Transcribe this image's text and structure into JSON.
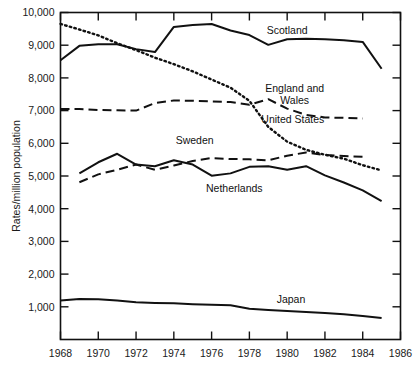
{
  "chart_data": {
    "type": "line",
    "title": "",
    "xlabel": "",
    "ylabel": "Rates/million population",
    "xlim": [
      1968,
      1986
    ],
    "ylim": [
      0,
      10000
    ],
    "xticks": [
      1968,
      1970,
      1972,
      1974,
      1976,
      1978,
      1980,
      1982,
      1984,
      1986
    ],
    "yticks": [
      1000,
      2000,
      3000,
      4000,
      5000,
      6000,
      7000,
      8000,
      9000,
      10000
    ],
    "ytick_labels": [
      "1,000",
      "2,000",
      "3,000",
      "4,000",
      "5,000",
      "6,000",
      "7,000",
      "8,000",
      "9,000",
      "10,000"
    ],
    "xtick_labels": [
      "1968",
      "1970",
      "1972",
      "1974",
      "1976",
      "1978",
      "1980",
      "1982",
      "1984",
      "1986"
    ],
    "grid": false,
    "legend_position": "inline-annotations",
    "series": [
      {
        "name": "Scotland",
        "style": "solid",
        "color": "#111111",
        "label_x": 1980.0,
        "label_y": 9350,
        "x": [
          1968,
          1969,
          1970,
          1971,
          1972,
          1973,
          1974,
          1975,
          1976,
          1977,
          1978,
          1979,
          1980,
          1981,
          1982,
          1983,
          1984,
          1985
        ],
        "y": [
          8540,
          8980,
          9030,
          9030,
          8880,
          8790,
          9560,
          9620,
          9650,
          9450,
          9310,
          9010,
          9180,
          9200,
          9180,
          9150,
          9100,
          8280
        ]
      },
      {
        "name": "United States",
        "style": "dotted",
        "color": "#111111",
        "label_x": 1980.3,
        "label_y": 6620,
        "x": [
          1968,
          1969,
          1970,
          1971,
          1972,
          1973,
          1974,
          1975,
          1976,
          1977,
          1978,
          1979,
          1980,
          1981,
          1982,
          1983,
          1984,
          1985
        ],
        "y": [
          9650,
          9480,
          9300,
          9060,
          8850,
          8620,
          8420,
          8200,
          7950,
          7700,
          7300,
          6500,
          6050,
          5800,
          5650,
          5530,
          5330,
          5170
        ]
      },
      {
        "name": "England and Wales",
        "style": "dashed",
        "color": "#111111",
        "label_x": 1980.4,
        "label_y": 7560,
        "label_line2": "Wales",
        "x": [
          1968,
          1969,
          1970,
          1971,
          1972,
          1973,
          1974,
          1975,
          1976,
          1977,
          1978,
          1979,
          1980,
          1981,
          1982,
          1983,
          1984
        ],
        "y": [
          7050,
          7050,
          7020,
          7010,
          7000,
          7230,
          7310,
          7300,
          7280,
          7260,
          7180,
          7350,
          7060,
          6870,
          6790,
          6780,
          6760
        ]
      },
      {
        "name": "Sweden",
        "style": "dashed",
        "color": "#111111",
        "label_x": 1975.1,
        "label_y": 5980,
        "x": [
          1969,
          1970,
          1971,
          1972,
          1973,
          1974,
          1975,
          1976,
          1977,
          1978,
          1979,
          1980,
          1981,
          1982,
          1983,
          1984
        ],
        "y": [
          4810,
          5050,
          5190,
          5350,
          5190,
          5320,
          5460,
          5550,
          5520,
          5510,
          5480,
          5620,
          5720,
          5640,
          5610,
          5590
        ]
      },
      {
        "name": "Netherlands",
        "style": "solid",
        "color": "#111111",
        "label_x": 1977.2,
        "label_y": 4500,
        "x": [
          1969,
          1970,
          1971,
          1972,
          1973,
          1974,
          1975,
          1976,
          1977,
          1978,
          1979,
          1980,
          1981,
          1982,
          1983,
          1984,
          1985
        ],
        "y": [
          5080,
          5420,
          5680,
          5350,
          5300,
          5480,
          5350,
          5010,
          5080,
          5280,
          5300,
          5190,
          5300,
          5020,
          4800,
          4560,
          4230
        ]
      },
      {
        "name": "Japan",
        "style": "solid",
        "color": "#111111",
        "label_x": 1980.2,
        "label_y": 1130,
        "x": [
          1968,
          1969,
          1970,
          1971,
          1972,
          1973,
          1974,
          1975,
          1976,
          1977,
          1978,
          1979,
          1980,
          1981,
          1982,
          1983,
          1984,
          1985
        ],
        "y": [
          1190,
          1240,
          1230,
          1190,
          1140,
          1120,
          1110,
          1080,
          1060,
          1050,
          940,
          900,
          870,
          840,
          810,
          770,
          720,
          660
        ]
      }
    ]
  },
  "axes": {
    "frame_color": "#111111",
    "tick_color": "#111111"
  }
}
